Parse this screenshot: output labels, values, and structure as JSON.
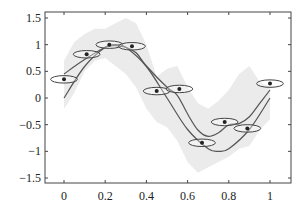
{
  "chart_data": {
    "type": "line",
    "title": "",
    "xlabel": "",
    "ylabel": "",
    "xlim": [
      -0.1,
      1.08
    ],
    "ylim": [
      -1.6,
      1.6
    ],
    "grid": false,
    "legend": null,
    "x_ticks": [
      0,
      0.2,
      0.4,
      0.6,
      0.8,
      1
    ],
    "x_tick_labels": [
      "0",
      "0.2",
      "0.4",
      "0.6",
      "0.8",
      "1"
    ],
    "y_ticks": [
      1.5,
      1,
      0.5,
      0,
      -0.5,
      -1,
      -1.5
    ],
    "y_tick_labels": [
      "1.5",
      "1",
      "0.5",
      "0",
      "−0.5",
      "−1",
      "−1.5"
    ],
    "observations": {
      "description": "noisy input observations shown as dots with horizontal ellipses (input uncertainty)",
      "x": [
        0.0,
        0.11,
        0.22,
        0.33,
        0.45,
        0.56,
        0.67,
        0.78,
        0.89,
        1.0
      ],
      "y": [
        0.35,
        0.82,
        1.0,
        0.97,
        0.13,
        0.17,
        -0.84,
        -0.45,
        -0.57,
        0.27
      ],
      "ellipse_half_width": 0.065,
      "ellipse_half_height": 0.07
    },
    "series": [
      {
        "name": "true function",
        "color": "#555555",
        "x": [
          0.0,
          0.1,
          0.2,
          0.25,
          0.3,
          0.4,
          0.5,
          0.6,
          0.7,
          0.75,
          0.8,
          0.9,
          1.0
        ],
        "y": [
          0.0,
          0.59,
          0.95,
          1.0,
          0.95,
          0.59,
          0.0,
          -0.59,
          -0.95,
          -1.0,
          -0.95,
          -0.59,
          0.0
        ]
      },
      {
        "name": "predictive mean",
        "color": "#555555",
        "x": [
          0.0,
          0.1,
          0.2,
          0.25,
          0.3,
          0.35,
          0.4,
          0.5,
          0.55,
          0.6,
          0.65,
          0.7,
          0.75,
          0.8,
          0.85,
          0.9,
          0.95,
          1.0
        ],
        "y": [
          0.45,
          0.72,
          0.95,
          0.98,
          0.95,
          0.85,
          0.6,
          0.2,
          0.05,
          -0.3,
          -0.6,
          -0.72,
          -0.65,
          -0.5,
          -0.48,
          -0.35,
          -0.1,
          0.15
        ]
      }
    ],
    "confidence_band": {
      "color": "#ebebeb",
      "x": [
        0.0,
        0.05,
        0.1,
        0.15,
        0.2,
        0.25,
        0.3,
        0.35,
        0.4,
        0.45,
        0.5,
        0.55,
        0.6,
        0.65,
        0.7,
        0.75,
        0.8,
        0.85,
        0.9,
        0.95,
        1.0
      ],
      "upper": [
        0.7,
        1.05,
        1.2,
        1.3,
        1.3,
        1.4,
        1.5,
        1.4,
        1.0,
        0.4,
        0.55,
        0.6,
        0.2,
        -0.1,
        -0.2,
        -0.05,
        0.15,
        0.45,
        0.6,
        0.3,
        0.2
      ],
      "lower": [
        -0.2,
        0.1,
        0.5,
        0.7,
        0.75,
        0.6,
        0.45,
        0.2,
        -0.2,
        -0.45,
        -0.55,
        -0.8,
        -1.2,
        -1.4,
        -1.3,
        -1.2,
        -1.1,
        -0.95,
        -0.9,
        -0.6,
        -0.4
      ]
    }
  }
}
